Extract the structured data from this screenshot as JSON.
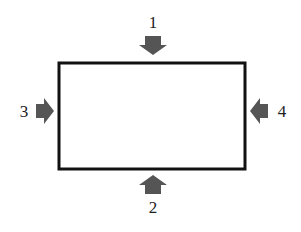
{
  "diagram": {
    "rectangle": {
      "x": 59,
      "y": 63,
      "width": 186,
      "height": 106,
      "stroke": "#111111",
      "stroke_width": 3
    },
    "arrow_color": "#555555",
    "arrows": [
      {
        "id": "1",
        "label": "1",
        "direction": "down",
        "position": "top"
      },
      {
        "id": "2",
        "label": "2",
        "direction": "up",
        "position": "bottom"
      },
      {
        "id": "3",
        "label": "3",
        "direction": "right",
        "position": "left"
      },
      {
        "id": "4",
        "label": "4",
        "direction": "left",
        "position": "right"
      }
    ]
  }
}
